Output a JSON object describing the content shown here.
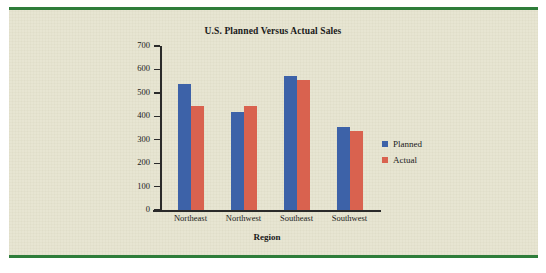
{
  "figure": {
    "panel_background": "#e7e5d2",
    "rule_color": "#2e7d3a"
  },
  "chart_data": {
    "type": "bar",
    "title": "U.S. Planned Versus Actual Sales",
    "xlabel": "Region",
    "ylabel": "Sales ($1000)",
    "categories": [
      "Northeast",
      "Northwest",
      "Southeast",
      "Southwest"
    ],
    "series": [
      {
        "name": "Planned",
        "color": "#3d62a8",
        "values": [
          537,
          420,
          572,
          356
        ]
      },
      {
        "name": "Actual",
        "color": "#d9624f",
        "values": [
          446,
          446,
          555,
          339
        ]
      }
    ],
    "ylim": [
      0,
      700
    ],
    "yticks": [
      0,
      100,
      200,
      300,
      400,
      500,
      600,
      700
    ],
    "ytick_labels": [
      "0",
      "100",
      "200",
      "300",
      "400",
      "500",
      "600",
      "700"
    ],
    "grid": false,
    "legend_position": "right"
  }
}
